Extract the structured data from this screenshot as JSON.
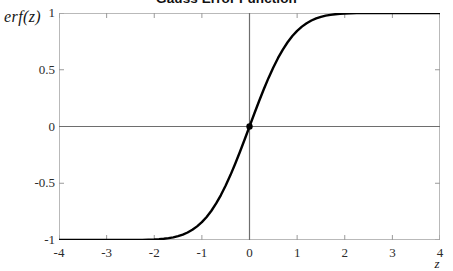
{
  "chart_data": {
    "type": "line",
    "title": "Gauss Error Function",
    "xlabel": "z",
    "ylabel": "erf(z)",
    "xlim": [
      -4,
      4
    ],
    "ylim": [
      -1,
      1
    ],
    "grid": false,
    "legend": "none",
    "xticks": [
      -4,
      -3,
      -2,
      -1,
      0,
      1,
      2,
      3,
      4
    ],
    "xtick_labels": [
      "-4",
      "-3",
      "-2",
      "-1",
      "0",
      "1",
      "2",
      "3",
      "4"
    ],
    "yticks": [
      -1,
      -0.5,
      0,
      0.5,
      1
    ],
    "ytick_labels": [
      "-1",
      "-0.5",
      "0",
      "0.5",
      "1"
    ],
    "series": [
      {
        "name": "erf(z)",
        "color": "#000000",
        "line_width": 2.4,
        "x": [
          -4,
          -3.75,
          -3.5,
          -3.25,
          -3,
          -2.75,
          -2.5,
          -2.25,
          -2,
          -1.9,
          -1.8,
          -1.7,
          -1.6,
          -1.5,
          -1.4,
          -1.3,
          -1.2,
          -1.1,
          -1,
          -0.9,
          -0.8,
          -0.7,
          -0.6,
          -0.5,
          -0.4,
          -0.3,
          -0.2,
          -0.1,
          0,
          0.1,
          0.2,
          0.3,
          0.4,
          0.5,
          0.6,
          0.7,
          0.8,
          0.9,
          1,
          1.1,
          1.2,
          1.3,
          1.4,
          1.5,
          1.6,
          1.7,
          1.8,
          1.9,
          2,
          2.25,
          2.5,
          2.75,
          3,
          3.25,
          3.5,
          3.75,
          4
        ],
        "y": [
          -1,
          -1,
          -0.999999,
          -0.999996,
          -0.99998,
          -0.9999,
          -0.999593,
          -0.998537,
          -0.995322,
          -0.99279,
          -0.989091,
          -0.98379,
          -0.976348,
          -0.966105,
          -0.952285,
          -0.934008,
          -0.910314,
          -0.880205,
          -0.842701,
          -0.796908,
          -0.742101,
          -0.677801,
          -0.603856,
          -0.5205,
          -0.428392,
          -0.328627,
          -0.222703,
          -0.112463,
          0,
          0.112463,
          0.222703,
          0.328627,
          0.428392,
          0.5205,
          0.603856,
          0.677801,
          0.742101,
          0.796908,
          0.842701,
          0.880205,
          0.910314,
          0.934008,
          0.952285,
          0.966105,
          0.976348,
          0.98379,
          0.989091,
          0.99279,
          0.995322,
          0.998537,
          0.999593,
          0.9999,
          0.99998,
          0.999996,
          0.999999,
          1,
          1
        ]
      }
    ],
    "markers": [
      {
        "name": "origin-marker",
        "x": 0,
        "y": 0,
        "color": "#000000",
        "radius": 3.2
      }
    ],
    "annotations": []
  },
  "axes": {
    "frame_color": "#b9b9b9",
    "zero_line_color": "#6e6e6e",
    "tick_color": "#9a9a9a"
  }
}
